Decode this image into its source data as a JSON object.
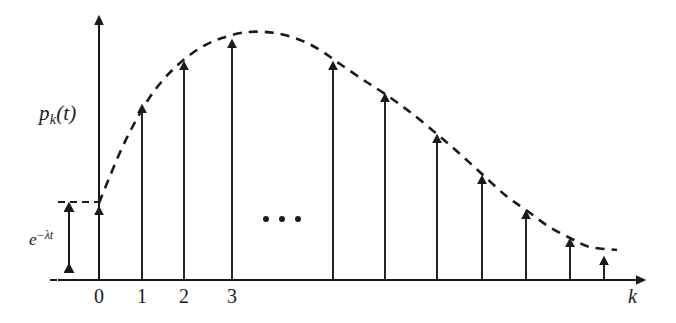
{
  "figure": {
    "kind": "stem-plot-with-envelope",
    "background_color": "#ffffff",
    "ink_color": "#1a1a1a",
    "y_axis_label": "p",
    "y_axis_label_sub": "k",
    "y_axis_label_tail": "(t)",
    "x_axis_label": "k",
    "bracket_label_base": "e",
    "bracket_label_exponent": "−λt",
    "ellipsis": "• • •"
  },
  "axis_ticks": [
    {
      "label": "0",
      "x": 99
    },
    {
      "label": "1",
      "x": 142
    },
    {
      "label": "2",
      "x": 184
    },
    {
      "label": "3",
      "x": 232
    }
  ],
  "chart_data": {
    "type": "line",
    "title": "",
    "xlabel": "k",
    "ylabel": "p_k(t)",
    "grid": false,
    "legend": null,
    "annotations": [
      {
        "name": "exponential-bracket",
        "text": "e^{-λt}",
        "meaning": "height of the k = 0 stem, the probability of zero events"
      },
      {
        "name": "ellipsis",
        "text": "• • •",
        "meaning": "omitted intermediate stems between k = 3 and the later indices"
      }
    ],
    "axis_ranges": {
      "x_pixels": [
        99,
        648
      ],
      "y_pixels": [
        280,
        13
      ]
    },
    "baseline_y": 280,
    "categories": [
      "0",
      "1",
      "2",
      "3",
      "",
      "",
      "",
      "",
      "",
      "",
      "",
      ""
    ],
    "stems": [
      {
        "k": "0",
        "x": 99,
        "tip_y": 203,
        "value": 0.28
      },
      {
        "k": "1",
        "x": 142,
        "tip_y": 101,
        "value": 0.67
      },
      {
        "k": "2",
        "x": 184,
        "tip_y": 58,
        "value": 0.83
      },
      {
        "k": "3",
        "x": 232,
        "tip_y": 36,
        "value": 0.91
      },
      {
        "k": "",
        "x": 333,
        "tip_y": 58,
        "value": 0.83
      },
      {
        "k": "",
        "x": 385,
        "tip_y": 90,
        "value": 0.71
      },
      {
        "k": "",
        "x": 437,
        "tip_y": 131,
        "value": 0.56
      },
      {
        "k": "",
        "x": 482,
        "tip_y": 172,
        "value": 0.4
      },
      {
        "k": "",
        "x": 526,
        "tip_y": 207,
        "value": 0.27
      },
      {
        "k": "",
        "x": 570,
        "tip_y": 235,
        "value": 0.17
      },
      {
        "k": "",
        "x": 604,
        "tip_y": 253,
        "value": 0.1
      }
    ],
    "envelope": {
      "name": "poisson-envelope",
      "style": "dashed",
      "points": [
        [
          99,
          203
        ],
        [
          110,
          176
        ],
        [
          122,
          148
        ],
        [
          134,
          124
        ],
        [
          148,
          100
        ],
        [
          163,
          80
        ],
        [
          180,
          63
        ],
        [
          200,
          48
        ],
        [
          222,
          38
        ],
        [
          248,
          32
        ],
        [
          275,
          33
        ],
        [
          300,
          40
        ],
        [
          320,
          50
        ],
        [
          340,
          64
        ],
        [
          362,
          79
        ],
        [
          385,
          94
        ],
        [
          410,
          112
        ],
        [
          437,
          134
        ],
        [
          460,
          154
        ],
        [
          482,
          174
        ],
        [
          505,
          195
        ],
        [
          526,
          210
        ],
        [
          548,
          226
        ],
        [
          570,
          238
        ],
        [
          590,
          247
        ],
        [
          617,
          250
        ]
      ]
    },
    "ellipsis_dots": [
      {
        "x": 266,
        "y": 219
      },
      {
        "x": 282,
        "y": 219
      },
      {
        "x": 298,
        "y": 219
      }
    ]
  }
}
